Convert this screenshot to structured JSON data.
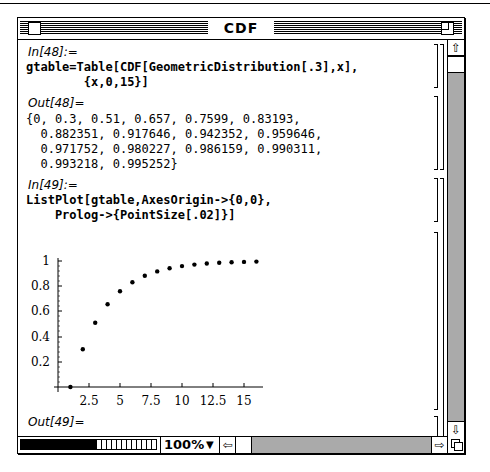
{
  "window": {
    "title": "CDF"
  },
  "cells": {
    "in48": {
      "label": "In[48]:=",
      "line1": "gtable=Table[CDF[GeometricDistribution[.3],x],",
      "line2": "        {x,0,15}]"
    },
    "out48": {
      "label": "Out[48]=",
      "line1": "{0, 0.3, 0.51, 0.657, 0.7599, 0.83193,",
      "line2": "  0.882351, 0.917646, 0.942352, 0.959646,",
      "line3": "  0.971752, 0.980227, 0.986159, 0.990311,",
      "line4": "  0.993218, 0.995252}"
    },
    "in49": {
      "label": "In[49]:=",
      "line1": "ListPlot[gtable,AxesOrigin->{0,0},",
      "line2": "    Prolog->{PointSize[.02]}]"
    },
    "out49": {
      "label": "Out[49]=",
      "value": "-Graphics-"
    }
  },
  "chart_data": {
    "type": "scatter",
    "title": "",
    "xlabel": "",
    "ylabel": "",
    "x": [
      1,
      2,
      3,
      4,
      5,
      6,
      7,
      8,
      9,
      10,
      11,
      12,
      13,
      14,
      15,
      16
    ],
    "values": [
      0,
      0.3,
      0.51,
      0.657,
      0.7599,
      0.83193,
      0.882351,
      0.917646,
      0.942352,
      0.959646,
      0.971752,
      0.980227,
      0.986159,
      0.990311,
      0.993218,
      0.995252
    ],
    "x_ticks": [
      "2.5",
      "5",
      "7.5",
      "10",
      "12.5",
      "15"
    ],
    "y_ticks": [
      "0.2",
      "0.4",
      "0.6",
      "0.8",
      "1"
    ],
    "xlim": [
      0,
      16.5
    ],
    "ylim": [
      0,
      1
    ],
    "grid": false,
    "legend": "none"
  },
  "statusbar": {
    "zoom_level": "100%"
  },
  "icons": {
    "scroll_up": "⇧",
    "scroll_down": "⇩",
    "scroll_left": "⇦",
    "scroll_right": "⇨",
    "dropdown": "▼"
  }
}
